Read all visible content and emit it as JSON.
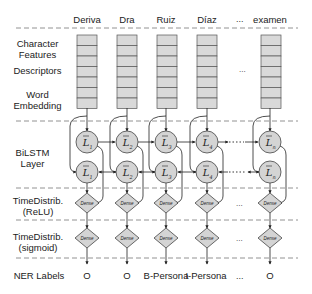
{
  "columns": [
    {
      "word": "Deriva",
      "label": "O",
      "cx": 87,
      "index": "1"
    },
    {
      "word": "Dra",
      "label": "O",
      "cx": 127,
      "index": "2"
    },
    {
      "word": "Ruiz",
      "label": "B-Persona",
      "cx": 166,
      "index": "3"
    },
    {
      "word": "Díaz",
      "label": "I-Persona",
      "cx": 207,
      "index": "4"
    },
    {
      "word": "examen",
      "label": "O",
      "cx": 270,
      "index": "n"
    }
  ],
  "ellipsis": "...",
  "row_labels": {
    "character_features": "Character Features",
    "descriptors": "Descriptors",
    "word_embedding": "Word Embedding",
    "bilstm": "BiLSTM Layer",
    "timedistrib_relu": "TimeDistrib. (ReLU)",
    "timedistrib_sigmoid": "TimeDistrib. (sigmoid)",
    "ner_labels": "NER Labels"
  },
  "node_labels": {
    "lstm_symbol": "L",
    "dense": "Dense"
  },
  "colors": {
    "cell_fill": "#d9d9d9",
    "cell_stroke": "#555555",
    "node_fill": "#d4d4d4",
    "line": "#333333",
    "dash": "#777777"
  }
}
